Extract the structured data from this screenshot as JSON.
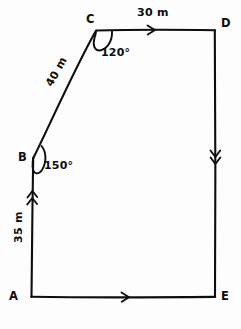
{
  "diagram": {
    "stroke_color": "#0d0d0d",
    "background_color": "#fdfdfd",
    "vertices": [
      {
        "name": "A",
        "label": "A",
        "x": 31,
        "y": 297
      },
      {
        "name": "B",
        "label": "B",
        "x": 33,
        "y": 158
      },
      {
        "name": "C",
        "label": "C",
        "x": 96,
        "y": 30
      },
      {
        "name": "D",
        "label": "D",
        "x": 215,
        "y": 30
      },
      {
        "name": "E",
        "label": "E",
        "x": 215,
        "y": 297
      }
    ],
    "edges": [
      {
        "name": "AB",
        "from": "A",
        "to": "B",
        "length_label": "35 m",
        "ticks": 2,
        "tick_direction": "up"
      },
      {
        "name": "BC",
        "from": "B",
        "to": "C",
        "length_label": "40 m",
        "ticks": 0,
        "tick_direction": "none"
      },
      {
        "name": "CD",
        "from": "C",
        "to": "D",
        "length_label": "30 m",
        "ticks": 1,
        "tick_direction": "right"
      },
      {
        "name": "DE",
        "from": "D",
        "to": "E",
        "length_label": "",
        "ticks": 2,
        "tick_direction": "down"
      },
      {
        "name": "EA",
        "from": "A",
        "to": "E",
        "length_label": "",
        "ticks": 1,
        "tick_direction": "right"
      }
    ],
    "angles": [
      {
        "name": "angle-at-C",
        "vertex": "C",
        "label": "120°"
      },
      {
        "name": "angle-at-B",
        "vertex": "B",
        "label": "150°"
      }
    ],
    "measures": {
      "cd": "30 m",
      "bc": "40 m",
      "ab": "35 m"
    },
    "angle_values": {
      "at_c": "120°",
      "at_b": "150°"
    }
  }
}
